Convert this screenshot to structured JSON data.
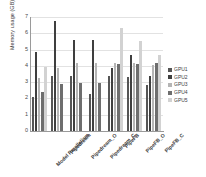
{
  "chart_data": {
    "type": "bar",
    "title": "",
    "xlabel": "",
    "ylabel": "Memory usage (GB)",
    "ylim": [
      0,
      7
    ],
    "yticks": [
      7,
      6,
      5,
      4,
      3,
      2,
      1,
      0
    ],
    "grid": true,
    "legend_position": "right",
    "categories": [
      "Model Parallelism",
      "Pipedream",
      "Pipedream_O",
      "Pipedream_C",
      "PipeFB",
      "PipeFB_O",
      "PipeFB_C"
    ],
    "series": [
      {
        "name": "GPU1",
        "color": "#555555",
        "values": [
          2.1,
          3.4,
          3.4,
          2.3,
          3.35,
          3.3,
          2.85
        ]
      },
      {
        "name": "GPU2",
        "color": "#3f3f3f",
        "values": [
          4.85,
          6.75,
          5.6,
          5.6,
          3.9,
          4.65,
          3.35
        ]
      },
      {
        "name": "GPU3",
        "color": "#b5b5b5",
        "values": [
          3.25,
          3.85,
          4.15,
          4.15,
          4.2,
          4.2,
          4.05
        ]
      },
      {
        "name": "GPU4",
        "color": "#6e6e6e",
        "values": [
          2.4,
          2.9,
          2.95,
          2.95,
          4.1,
          4.1,
          4.15
        ]
      },
      {
        "name": "GPU5",
        "color": "#d2d2d2",
        "values": [
          3.95,
          0.0,
          0.0,
          0.0,
          6.3,
          5.55,
          4.65
        ]
      }
    ],
    "legend": [
      "GPU1",
      "GPU2",
      "GPU3",
      "GPU4",
      "GPU5"
    ]
  }
}
